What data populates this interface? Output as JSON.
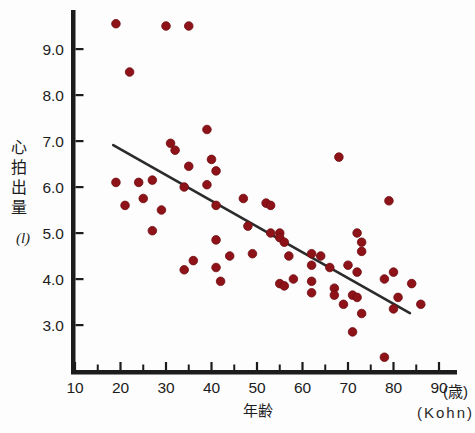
{
  "figure": {
    "ylabel": "心拍出量",
    "y_unit": "(l)",
    "xlabel": "年齢",
    "x_unit": "(歳)",
    "source": "(Kohn)"
  },
  "chart_data": {
    "type": "scatter",
    "title": "",
    "xlabel": "年齢",
    "x_unit_label": "(歳)",
    "ylabel": "心拍出量",
    "y_unit_label": "(l)",
    "source": "(Kohn)",
    "xlim": [
      10,
      92
    ],
    "ylim": [
      2.1,
      9.9
    ],
    "grid": false,
    "legend": "none",
    "x_ticks": [
      10,
      20,
      30,
      40,
      50,
      60,
      70,
      80,
      90
    ],
    "x_minor_ticks": [
      15,
      25,
      35,
      45,
      55,
      65,
      75,
      85
    ],
    "y_ticks": [
      3.0,
      4.0,
      5.0,
      6.0,
      7.0,
      8.0,
      9.0
    ],
    "y_tick_labels": [
      "3.0",
      "4.0",
      "5.0",
      "6.0",
      "7.0",
      "8.0",
      "9.0"
    ],
    "point_color": "#8e1318",
    "point_edge_color": "#6e0d11",
    "line_color": "#2b2b2b",
    "axis_color": "#1c1c1c",
    "text_color": "#1c1c1c",
    "regression_line": {
      "x1": 18.4,
      "y1": 6.91,
      "x2": 83.6,
      "y2": 3.26
    },
    "points": [
      [
        19,
        9.55
      ],
      [
        30,
        9.5
      ],
      [
        35,
        9.5
      ],
      [
        22,
        8.5
      ],
      [
        39,
        7.25
      ],
      [
        31,
        6.95
      ],
      [
        32,
        6.8
      ],
      [
        68,
        6.65
      ],
      [
        40,
        6.6
      ],
      [
        35,
        6.45
      ],
      [
        41,
        6.35
      ],
      [
        27,
        6.15
      ],
      [
        19,
        6.1
      ],
      [
        24,
        6.1
      ],
      [
        39,
        6.05
      ],
      [
        34,
        6.0
      ],
      [
        47,
        5.75
      ],
      [
        25,
        5.75
      ],
      [
        79,
        5.7
      ],
      [
        52,
        5.65
      ],
      [
        21,
        5.6
      ],
      [
        53,
        5.6
      ],
      [
        41,
        5.6
      ],
      [
        29,
        5.5
      ],
      [
        48,
        5.15
      ],
      [
        27,
        5.05
      ],
      [
        53,
        5.0
      ],
      [
        55,
        5.0
      ],
      [
        72,
        5.0
      ],
      [
        55,
        4.9
      ],
      [
        41,
        4.85
      ],
      [
        56,
        4.8
      ],
      [
        73,
        4.8
      ],
      [
        73,
        4.6
      ],
      [
        49,
        4.55
      ],
      [
        62,
        4.55
      ],
      [
        44,
        4.5
      ],
      [
        57,
        4.5
      ],
      [
        64,
        4.5
      ],
      [
        36,
        4.4
      ],
      [
        62,
        4.3
      ],
      [
        70,
        4.3
      ],
      [
        66,
        4.25
      ],
      [
        41,
        4.25
      ],
      [
        34,
        4.2
      ],
      [
        72,
        4.15
      ],
      [
        80,
        4.15
      ],
      [
        58,
        4.0
      ],
      [
        78,
        4.0
      ],
      [
        42,
        3.95
      ],
      [
        62,
        3.95
      ],
      [
        55,
        3.9
      ],
      [
        84,
        3.9
      ],
      [
        56,
        3.85
      ],
      [
        67,
        3.8
      ],
      [
        62,
        3.7
      ],
      [
        71,
        3.65
      ],
      [
        67,
        3.65
      ],
      [
        72,
        3.6
      ],
      [
        81,
        3.6
      ],
      [
        69,
        3.45
      ],
      [
        86,
        3.45
      ],
      [
        80,
        3.35
      ],
      [
        73,
        3.25
      ],
      [
        71,
        2.85
      ],
      [
        78,
        2.3
      ]
    ]
  }
}
